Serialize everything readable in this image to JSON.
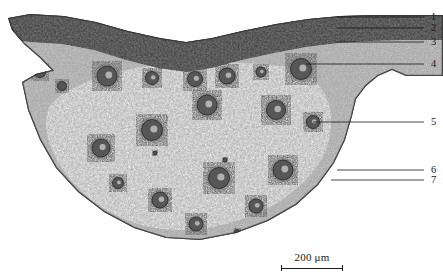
{
  "figure": {
    "kind": "light-micrograph",
    "staining": "grayscale",
    "width_px": 443,
    "height_px": 275,
    "background_color": "#ffffff",
    "ink_color": "#1a1a1a",
    "corner_artifact_text": "· ·····"
  },
  "scalebar": {
    "caption": "200 μm",
    "value": 200,
    "unit": "μm",
    "bar_length_px": 62,
    "left_px": 274,
    "top_px": 251
  },
  "leaders": [
    {
      "id": "1",
      "label": "1",
      "label_x": 431,
      "label_y": 12,
      "line_x1": 337,
      "line_y1": 17,
      "line_x2": 424,
      "line_y2": 17
    },
    {
      "id": "2",
      "label": "2",
      "label_x": 431,
      "label_y": 23,
      "line_x1": 337,
      "line_y1": 28,
      "line_x2": 424,
      "line_y2": 28
    },
    {
      "id": "3",
      "label": "3",
      "label_x": 431,
      "label_y": 37,
      "line_x1": 337,
      "line_y1": 42,
      "line_x2": 424,
      "line_y2": 42
    },
    {
      "id": "4",
      "label": "4",
      "label_x": 431,
      "label_y": 59,
      "line_x1": 306,
      "line_y1": 64,
      "line_x2": 424,
      "line_y2": 64
    },
    {
      "id": "5",
      "label": "5",
      "label_x": 431,
      "label_y": 117,
      "line_x1": 313,
      "line_y1": 122,
      "line_x2": 424,
      "line_y2": 122
    },
    {
      "id": "6",
      "label": "6",
      "label_x": 431,
      "label_y": 165,
      "line_x1": 337,
      "line_y1": 170,
      "line_x2": 424,
      "line_y2": 170
    },
    {
      "id": "7",
      "label": "7",
      "label_x": 431,
      "label_y": 175,
      "line_x1": 331,
      "line_y1": 180,
      "line_x2": 424,
      "line_y2": 180
    }
  ],
  "specimen": {
    "outline_path": "M 8 18 L 30 14 L 64 16 L 96 22 L 128 31 L 160 38 L 186 42 L 212 38 L 242 31 L 276 24 L 308 19 L 340 16 L 372 15 L 400 15 L 443 15 L 443 76 L 406 76 L 392 70 L 378 76 L 366 86 L 356 99 L 352 116 L 345 140 L 334 163 L 318 185 L 296 205 L 268 221 L 236 233 L 200 240 L 166 238 L 134 228 L 104 212 L 78 192 L 56 168 L 40 140 L 28 110 L 22 82 L 36 74 L 52 70 L 40 58 L 24 44 L 12 30 Z",
    "dark_band_path": "M 8 18 L 30 14 L 64 16 L 96 22 L 128 31 L 160 38 L 186 42 L 212 38 L 242 31 L 276 24 L 308 19 L 340 16 L 372 15 L 400 15 L 443 15 L 443 40 L 404 40 L 370 41 L 338 43 L 306 47 L 274 53 L 242 60 L 212 68 L 186 72 L 158 68 L 126 60 L 94 50 L 62 44 L 30 42 L 14 40 Z",
    "cortex_tone": "#b9b9b9",
    "parenchyma_tone": "#eeeeee",
    "bundle_tone": "#555555"
  },
  "vascular_bundles": [
    {
      "cx": 40,
      "cy": 72,
      "r": 5.5
    },
    {
      "cx": 62,
      "cy": 86,
      "r": 4.5
    },
    {
      "cx": 107,
      "cy": 76,
      "r": 10.0
    },
    {
      "cx": 152,
      "cy": 78,
      "r": 6.5
    },
    {
      "cx": 195,
      "cy": 79,
      "r": 7.5
    },
    {
      "cx": 227,
      "cy": 76,
      "r": 8.0
    },
    {
      "cx": 261,
      "cy": 72,
      "r": 5.0
    },
    {
      "cx": 301,
      "cy": 69,
      "r": 10.5
    },
    {
      "cx": 207,
      "cy": 105,
      "r": 10.0
    },
    {
      "cx": 276,
      "cy": 110,
      "r": 9.5
    },
    {
      "cx": 313,
      "cy": 122,
      "r": 6.5
    },
    {
      "cx": 152,
      "cy": 130,
      "r": 10.5
    },
    {
      "cx": 101,
      "cy": 148,
      "r": 9.0
    },
    {
      "cx": 283,
      "cy": 170,
      "r": 10.0
    },
    {
      "cx": 219,
      "cy": 178,
      "r": 10.5
    },
    {
      "cx": 118,
      "cy": 183,
      "r": 5.5
    },
    {
      "cx": 160,
      "cy": 200,
      "r": 8.0
    },
    {
      "cx": 196,
      "cy": 224,
      "r": 7.0
    },
    {
      "cx": 256,
      "cy": 206,
      "r": 7.0
    },
    {
      "cx": 331,
      "cy": 180,
      "r": 4.0
    },
    {
      "cx": 237,
      "cy": 232,
      "r": 2.5
    },
    {
      "cx": 155,
      "cy": 153,
      "r": 2.0
    },
    {
      "cx": 225,
      "cy": 160,
      "r": 2.0
    }
  ]
}
